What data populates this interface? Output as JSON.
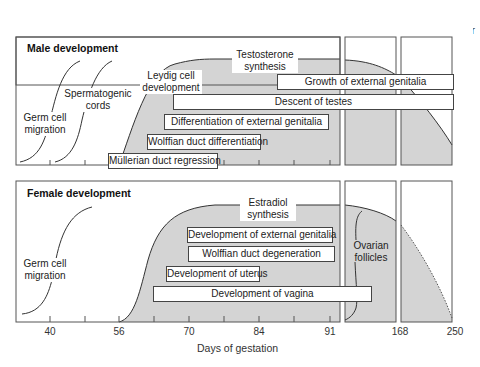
{
  "trimesters": [
    {
      "line1": "1st",
      "line2": "Trimester"
    },
    {
      "line1": "2nd",
      "line2": "Trimester"
    },
    {
      "line1": "3rd",
      "line2": "Trimester"
    }
  ],
  "male": {
    "title": "Male development",
    "labels": {
      "germ_cell": [
        "Germ cell",
        "migration"
      ],
      "spermatogenic": [
        "Spermatogenic",
        "cords"
      ],
      "leydig": [
        "Leydig cell",
        "development"
      ],
      "hormone": [
        "Testosterone",
        "synthesis"
      ]
    },
    "bars": [
      {
        "label": "Growth of external genitalia"
      },
      {
        "label": "Descent of testes"
      },
      {
        "label": "Differentiation of external genitalia"
      },
      {
        "label": "Wolffian duct differentiation"
      },
      {
        "label": "Müllerian duct regression"
      }
    ]
  },
  "female": {
    "title": "Female development",
    "labels": {
      "germ_cell": [
        "Germ cell",
        "migration"
      ],
      "hormone": [
        "Estradiol",
        "synthesis"
      ],
      "follicles": [
        "Ovarian",
        "follicles"
      ]
    },
    "bars": [
      {
        "label": "Development of external genitalia"
      },
      {
        "label": "Wolffian duct degeneration"
      },
      {
        "label": "Development of uterus"
      },
      {
        "label": "Development of vagina"
      }
    ]
  },
  "x_axis": {
    "title": "Days of gestation",
    "ticks": [
      "40",
      "56",
      "70",
      "84",
      "91",
      "168",
      "250"
    ]
  },
  "colors": {
    "shade": "#d4d4d4",
    "border": "#444444",
    "text": "#222222"
  }
}
